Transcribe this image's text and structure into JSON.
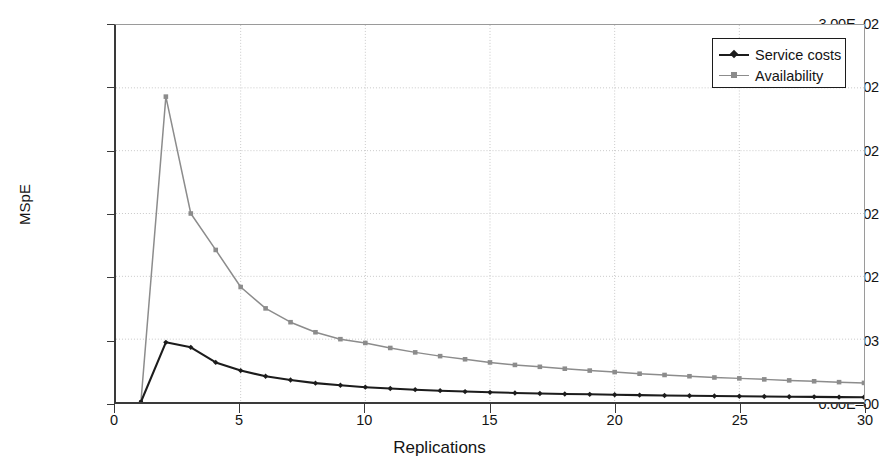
{
  "chart_data": {
    "type": "line",
    "title": "",
    "xlabel": "Replications",
    "ylabel": "MSpE",
    "xlim": [
      0,
      30
    ],
    "ylim": [
      0,
      0.03
    ],
    "grid": true,
    "legend_position": "top-right",
    "x_ticks": [
      {
        "value": 0,
        "label": "0"
      },
      {
        "value": 5,
        "label": "5"
      },
      {
        "value": 10,
        "label": "10"
      },
      {
        "value": 15,
        "label": "15"
      },
      {
        "value": 20,
        "label": "20"
      },
      {
        "value": 25,
        "label": "25"
      },
      {
        "value": 30,
        "label": "30"
      }
    ],
    "y_ticks": [
      {
        "value": 0.03,
        "label": "3.00E–02"
      },
      {
        "value": 0.025,
        "label": "2.50E–02"
      },
      {
        "value": 0.02,
        "label": "2.00E–02"
      },
      {
        "value": 0.015,
        "label": "1.50E–02"
      },
      {
        "value": 0.01,
        "label": "1.00E–02"
      },
      {
        "value": 0.005,
        "label": "5.00E–03"
      },
      {
        "value": 0.0,
        "label": "0.00E–00"
      }
    ],
    "x": [
      1,
      2,
      3,
      4,
      5,
      6,
      7,
      8,
      9,
      10,
      11,
      12,
      13,
      14,
      15,
      16,
      17,
      18,
      19,
      20,
      21,
      22,
      23,
      24,
      25,
      26,
      27,
      28,
      29,
      30
    ],
    "series": [
      {
        "name": "Service costs",
        "color": "#1c1c1c",
        "marker": "diamond",
        "values": [
          0.0,
          0.00475,
          0.00435,
          0.00315,
          0.0025,
          0.00205,
          0.00175,
          0.0015,
          0.00133,
          0.00118,
          0.00107,
          0.00098,
          0.0009,
          0.00083,
          0.00077,
          0.00072,
          0.00068,
          0.00064,
          0.00061,
          0.00058,
          0.00055,
          0.00052,
          0.0005,
          0.00048,
          0.00046,
          0.00044,
          0.00042,
          0.00041,
          0.00039,
          0.00038
        ]
      },
      {
        "name": "Availability",
        "color": "#8c8c8c",
        "marker": "square",
        "values": [
          0.0,
          0.0243,
          0.015,
          0.0121,
          0.00915,
          0.00745,
          0.00635,
          0.00555,
          0.005,
          0.0047,
          0.0043,
          0.00395,
          0.00365,
          0.0034,
          0.00315,
          0.00295,
          0.0028,
          0.00265,
          0.0025,
          0.00238,
          0.00225,
          0.00215,
          0.00205,
          0.00195,
          0.00188,
          0.0018,
          0.00172,
          0.00165,
          0.00158,
          0.00152
        ]
      }
    ]
  },
  "legend": {
    "items": [
      {
        "label": "Service costs"
      },
      {
        "label": "Availability"
      }
    ]
  },
  "axes": {
    "x_title": "Replications",
    "y_title": "MSpE"
  },
  "colors": {
    "series_service_costs": "#1c1c1c",
    "series_availability": "#8c8c8c",
    "axis": "#3a3a3a",
    "grid": "#c9c9c9",
    "background": "#ffffff"
  }
}
